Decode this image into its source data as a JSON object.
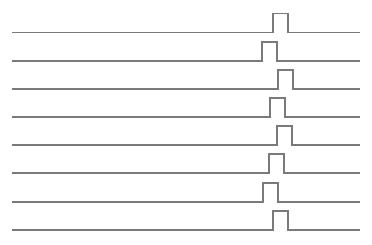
{
  "diagram": {
    "type": "pulse-timing-diagram",
    "line_color": "#7a7a7a",
    "background": "#ffffff",
    "x_start": 12,
    "x_end": 360,
    "pulse_height": 19,
    "pulse_width": 15,
    "traces": [
      {
        "baseline_y": 32.5,
        "pulse_x": 273
      },
      {
        "baseline_y": 61,
        "pulse_x": 262
      },
      {
        "baseline_y": 89,
        "pulse_x": 278
      },
      {
        "baseline_y": 117,
        "pulse_x": 270
      },
      {
        "baseline_y": 145,
        "pulse_x": 277
      },
      {
        "baseline_y": 173,
        "pulse_x": 269
      },
      {
        "baseline_y": 202,
        "pulse_x": 263
      },
      {
        "baseline_y": 230,
        "pulse_x": 273
      }
    ]
  }
}
